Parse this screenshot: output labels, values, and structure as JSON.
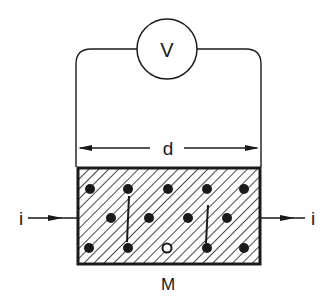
{
  "diagram": {
    "colors": {
      "ink": "#1a1a1a",
      "background": "#ffffff"
    },
    "voltmeter": {
      "label": "V",
      "cx": 167,
      "cy": 49,
      "r": 30
    },
    "dimension": {
      "label": "d"
    },
    "sample": {
      "label": "M"
    },
    "current_in": {
      "label": "i"
    },
    "current_out": {
      "label": "i"
    },
    "charge_carriers": {
      "rows": [
        {
          "y": 189,
          "x": [
            90,
            128,
            168,
            207,
            244
          ]
        },
        {
          "y": 218,
          "x": [
            111,
            149,
            188,
            227
          ]
        },
        {
          "y": 248,
          "x": [
            89,
            128,
            167,
            207,
            244
          ]
        }
      ]
    }
  }
}
